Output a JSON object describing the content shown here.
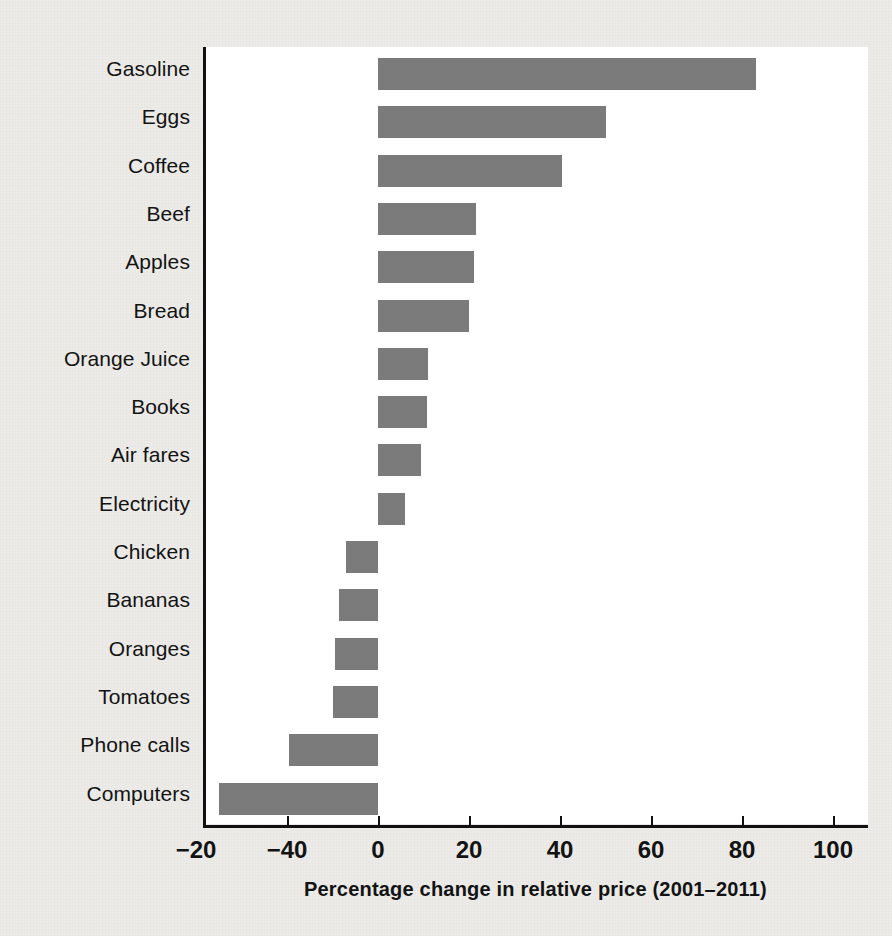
{
  "chart_data": {
    "type": "bar",
    "orientation": "horizontal",
    "title": "",
    "xlabel": "Percentage change in relative price (2001–2011)",
    "ylabel": "",
    "xlim": [
      -40,
      100
    ],
    "grid": false,
    "legend": null,
    "bar_color": "#7b7b7b",
    "background_color": "#ecebe8",
    "plot_background_color": "#ffffff",
    "axis_color": "#111111",
    "xticks": [
      {
        "value": -40,
        "label": "−20"
      },
      {
        "value": -20,
        "label": "−40"
      },
      {
        "value": 0,
        "label": "0"
      },
      {
        "value": 20,
        "label": "20"
      },
      {
        "value": 40,
        "label": "40"
      },
      {
        "value": 60,
        "label": "60"
      },
      {
        "value": 80,
        "label": "80"
      },
      {
        "value": 100,
        "label": "100"
      }
    ],
    "categories": [
      "Gasoline",
      "Eggs",
      "Coffee",
      "Beef",
      "Apples",
      "Bread",
      "Orange Juice",
      "Books",
      "Air fares",
      "Electricity",
      "Chicken",
      "Bananas",
      "Oranges",
      "Tomatoes",
      "Phone calls",
      "Computers"
    ],
    "values": [
      83,
      50,
      40.5,
      21.5,
      21,
      20,
      11,
      10.8,
      9.5,
      6,
      -7,
      -8.5,
      -9.5,
      -10,
      -19.5,
      -35
    ]
  }
}
